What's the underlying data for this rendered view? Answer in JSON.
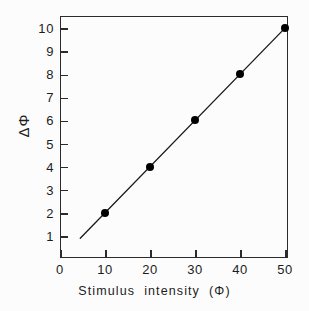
{
  "chart_data": {
    "type": "scatter",
    "title": "",
    "subtitle": "",
    "xlabel": "Stimulus  intensity  (Φ)",
    "ylabel": "ΔΦ",
    "xlim": [
      0,
      52
    ],
    "ylim": [
      0,
      10.8
    ],
    "xticks": [
      0,
      10,
      20,
      30,
      40,
      50
    ],
    "xticklabels": [
      "0",
      "10",
      "20",
      "30",
      "40",
      "50"
    ],
    "yticks": [
      1,
      2,
      3,
      4,
      5,
      6,
      7,
      8,
      9,
      10
    ],
    "yticklabels": [
      "1",
      "2",
      "3",
      "4",
      "5",
      "6",
      "7",
      "8",
      "9",
      "10"
    ],
    "grid": false,
    "legend": null,
    "tick_direction": "in",
    "series": [
      {
        "name": "ΔΦ vs stimulus intensity",
        "marker": "filled-circle",
        "marker_color": "#000000",
        "line_color": "#1a1a1a",
        "x": [
          10,
          20,
          30,
          40,
          50
        ],
        "y": [
          2,
          4,
          6,
          8,
          10
        ]
      }
    ],
    "fit_line": {
      "type": "linear",
      "slope": 0.2,
      "intercept": 0,
      "x_start": 4.5,
      "x_end": 50.2,
      "y_start": 0.9,
      "y_end": 10.04,
      "color": "#1a1a1a",
      "width": 1.3
    },
    "annotations": []
  },
  "axes": {
    "frame_color": "#2b2b2b",
    "background": "#fcfcfc"
  }
}
